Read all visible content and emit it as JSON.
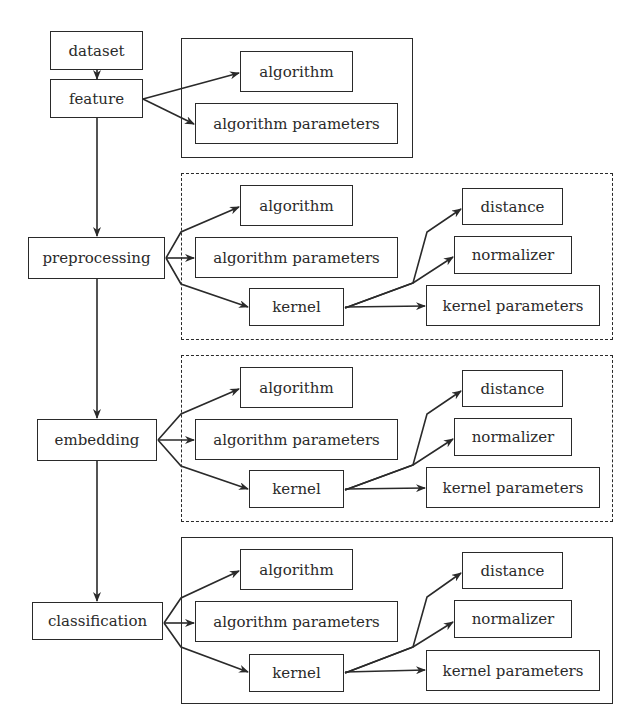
{
  "diagram": {
    "nodes": {
      "dataset": "dataset",
      "feature": "feature",
      "preprocessing": "preprocessing",
      "embedding": "embedding",
      "classification": "classification"
    },
    "groups": [
      {
        "id": "feature-group",
        "style": "solid",
        "items": {
          "algorithm": "algorithm",
          "algorithm_parameters": "algorithm parameters"
        }
      },
      {
        "id": "preprocessing-group",
        "style": "dashed",
        "items": {
          "algorithm": "algorithm",
          "algorithm_parameters": "algorithm parameters",
          "kernel": "kernel",
          "distance": "distance",
          "normalizer": "normalizer",
          "kernel_parameters": "kernel parameters"
        }
      },
      {
        "id": "embedding-group",
        "style": "dashed",
        "items": {
          "algorithm": "algorithm",
          "algorithm_parameters": "algorithm parameters",
          "kernel": "kernel",
          "distance": "distance",
          "normalizer": "normalizer",
          "kernel_parameters": "kernel parameters"
        }
      },
      {
        "id": "classification-group",
        "style": "solid",
        "items": {
          "algorithm": "algorithm",
          "algorithm_parameters": "algorithm parameters",
          "kernel": "kernel",
          "distance": "distance",
          "normalizer": "normalizer",
          "kernel_parameters": "kernel parameters"
        }
      }
    ],
    "edges": [
      [
        "dataset",
        "feature"
      ],
      [
        "feature",
        "preprocessing"
      ],
      [
        "preprocessing",
        "embedding"
      ],
      [
        "embedding",
        "classification"
      ],
      [
        "feature",
        "feature-group.algorithm"
      ],
      [
        "feature",
        "feature-group.algorithm_parameters"
      ],
      [
        "preprocessing",
        "preprocessing-group.algorithm"
      ],
      [
        "preprocessing",
        "preprocessing-group.algorithm_parameters"
      ],
      [
        "preprocessing",
        "preprocessing-group.kernel"
      ],
      [
        "preprocessing-group.kernel",
        "preprocessing-group.distance"
      ],
      [
        "preprocessing-group.kernel",
        "preprocessing-group.normalizer"
      ],
      [
        "preprocessing-group.kernel",
        "preprocessing-group.kernel_parameters"
      ],
      [
        "embedding",
        "embedding-group.algorithm"
      ],
      [
        "embedding",
        "embedding-group.algorithm_parameters"
      ],
      [
        "embedding",
        "embedding-group.kernel"
      ],
      [
        "embedding-group.kernel",
        "embedding-group.distance"
      ],
      [
        "embedding-group.kernel",
        "embedding-group.normalizer"
      ],
      [
        "embedding-group.kernel",
        "embedding-group.kernel_parameters"
      ],
      [
        "classification",
        "classification-group.algorithm"
      ],
      [
        "classification",
        "classification-group.algorithm_parameters"
      ],
      [
        "classification",
        "classification-group.kernel"
      ],
      [
        "classification-group.kernel",
        "classification-group.distance"
      ],
      [
        "classification-group.kernel",
        "classification-group.normalizer"
      ],
      [
        "classification-group.kernel",
        "classification-group.kernel_parameters"
      ]
    ],
    "colors": {
      "stroke": "#2a2a2a",
      "background": "#ffffff"
    }
  }
}
